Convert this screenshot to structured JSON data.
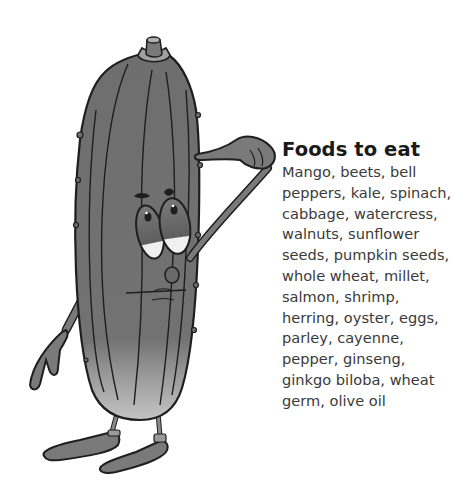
{
  "illustration": {
    "subject": "cartoon cucumber character pointing to its head",
    "icon": "cucumber-character-icon",
    "colors": {
      "body": "#6e6e6e",
      "body_light": "#a8a8a8",
      "outline": "#1e1e1e",
      "eye_white": "#f2f2f2"
    }
  },
  "panel": {
    "title": "Foods to eat",
    "lines": [
      "Mango, beets, bell",
      "peppers, kale, spinach,",
      "cabbage, watercress,",
      "walnuts, sunflower",
      "seeds, pumpkin seeds,",
      "whole wheat, millet,",
      "salmon, shrimp,",
      "herring, oyster, eggs,",
      "parley, cayenne,",
      "pepper, ginseng,",
      "ginkgo biloba, wheat",
      "germ, olive oil"
    ]
  }
}
